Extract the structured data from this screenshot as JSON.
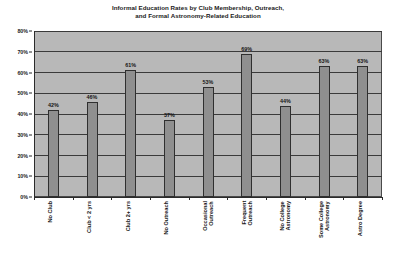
{
  "chart_data": {
    "type": "bar",
    "title": "Informal Education Rates by Club Membership, Outreach, and Formal Astronomy-Related Education",
    "title_lines": [
      "Informal Education Rates by Club Membership, Outreach,",
      "and Formal Astronomy-Related Education"
    ],
    "xlabel": "",
    "ylabel": "",
    "ylim": [
      0,
      80
    ],
    "ytick_values": [
      0,
      10,
      20,
      30,
      40,
      50,
      60,
      70,
      80
    ],
    "ytick_labels": [
      "0%",
      "10%",
      "20%",
      "30%",
      "40%",
      "50%",
      "60%",
      "70%",
      "80%"
    ],
    "grid": true,
    "grid_axis": "y",
    "legend": false,
    "categories": [
      "No Club",
      "Club < 2 yrs",
      "Club 2+ yrs",
      "No Outreach",
      "Occasional Outreach",
      "Frequent Outreach",
      "No College Astronomy",
      "Some College Astronomy",
      "Astro Degree"
    ],
    "category_lines": [
      [
        "No Club"
      ],
      [
        "Club < 2 yrs"
      ],
      [
        "Club 2+ yrs"
      ],
      [
        "No Outreach"
      ],
      [
        "Occasional",
        "Outreach"
      ],
      [
        "Frequent",
        "Outreach"
      ],
      [
        "No College",
        "Astronomy"
      ],
      [
        "Some College",
        "Astronomy"
      ],
      [
        "Astro Degree"
      ]
    ],
    "values": [
      42,
      46,
      61,
      37,
      53,
      69,
      44,
      63,
      63
    ],
    "value_labels": [
      "42%",
      "46%",
      "61%",
      "37%",
      "53%",
      "69%",
      "44%",
      "63%",
      "63%"
    ],
    "groups": [
      {
        "name": "Club Membership",
        "indices": [
          0,
          1,
          2
        ]
      },
      {
        "name": "Outreach",
        "indices": [
          3,
          4,
          5
        ]
      },
      {
        "name": "Formal Astronomy-Related Education",
        "indices": [
          6,
          7,
          8
        ]
      }
    ],
    "colors": {
      "bar_fill": "#8f8f8f",
      "bar_edge": "#2f2f2f",
      "plot_background": "#b8b8b8",
      "gridline": "#3a3a3a",
      "axis": "#2b2b2b",
      "text": "#151515",
      "figure_background": "#ffffff"
    }
  }
}
